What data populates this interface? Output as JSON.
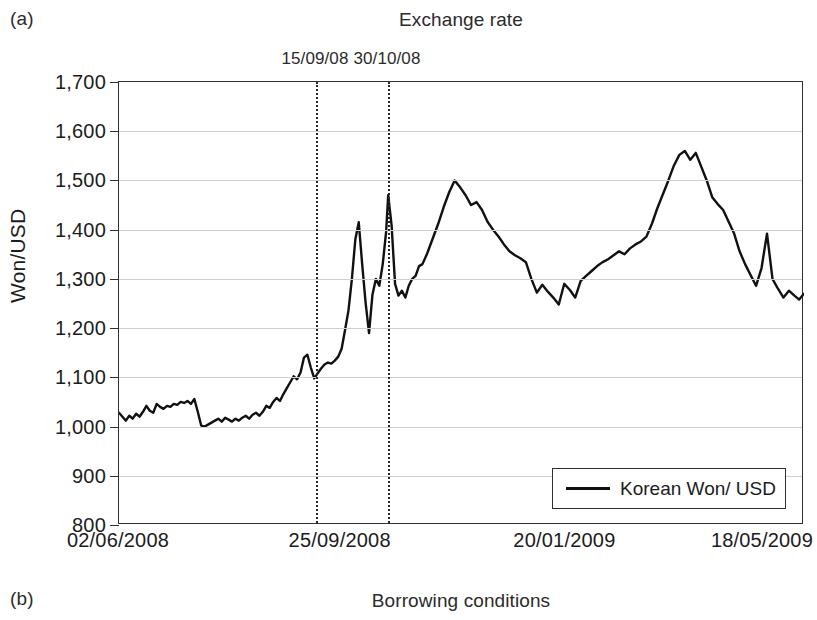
{
  "figure": {
    "panel_a_letter": "(a)",
    "panel_a_title": "Exchange rate",
    "panel_b_letter": "(b)",
    "panel_b_title": "Borrowing conditions"
  },
  "axes": {
    "y_title": "Won/USD",
    "y_ticks": [
      "1,700",
      "1,600",
      "1,500",
      "1,400",
      "1,300",
      "1,200",
      "1,100",
      "1,000",
      "900",
      "800"
    ],
    "x_ticks": [
      "02/06/2008",
      "25/09/2008",
      "20/01/2009",
      "18/05/2009"
    ]
  },
  "events": [
    {
      "label": "15/09/08",
      "x_frac": 0.2876
    },
    {
      "label": "30/10/08",
      "x_frac": 0.3927
    }
  ],
  "legend": {
    "label": "Korean Won/ USD",
    "line_color": "#111111"
  },
  "chart_data": {
    "type": "line",
    "title": "Exchange rate",
    "xlabel": "",
    "ylabel": "Won/USD",
    "ylim": [
      800,
      1700
    ],
    "ytick_step": 100,
    "grid": true,
    "legend_position": "bottom-right",
    "x_tick_labels": [
      "02/06/2008",
      "25/09/2008",
      "20/01/2009",
      "18/05/2009"
    ],
    "x_tick_fracs": [
      0.0,
      0.3236,
      0.6517,
      0.9651
    ],
    "annotations": [
      {
        "text": "15/09/08",
        "type": "vertical-dotted-line",
        "x_frac": 0.2876
      },
      {
        "text": "30/10/08",
        "type": "vertical-dotted-line",
        "x_frac": 0.3927
      }
    ],
    "series": [
      {
        "name": "Korean Won/ USD",
        "color": "#111111",
        "x": [
          0.0,
          0.005,
          0.01,
          0.015,
          0.02,
          0.025,
          0.03,
          0.035,
          0.04,
          0.045,
          0.05,
          0.055,
          0.06,
          0.065,
          0.07,
          0.075,
          0.08,
          0.085,
          0.09,
          0.095,
          0.1,
          0.105,
          0.11,
          0.115,
          0.12,
          0.125,
          0.13,
          0.135,
          0.14,
          0.145,
          0.15,
          0.155,
          0.16,
          0.165,
          0.17,
          0.175,
          0.18,
          0.185,
          0.19,
          0.195,
          0.2,
          0.205,
          0.21,
          0.215,
          0.22,
          0.225,
          0.23,
          0.235,
          0.24,
          0.245,
          0.25,
          0.255,
          0.26,
          0.265,
          0.27,
          0.275,
          0.28,
          0.285,
          0.29,
          0.295,
          0.3,
          0.305,
          0.31,
          0.315,
          0.32,
          0.325,
          0.33,
          0.335,
          0.34,
          0.345,
          0.35,
          0.355,
          0.36,
          0.365,
          0.37,
          0.375,
          0.38,
          0.385,
          0.39,
          0.393,
          0.398,
          0.403,
          0.408,
          0.413,
          0.418,
          0.423,
          0.428,
          0.433,
          0.438,
          0.443,
          0.45,
          0.458,
          0.466,
          0.474,
          0.482,
          0.49,
          0.498,
          0.506,
          0.514,
          0.522,
          0.53,
          0.538,
          0.546,
          0.554,
          0.562,
          0.57,
          0.578,
          0.586,
          0.594,
          0.602,
          0.61,
          0.618,
          0.626,
          0.634,
          0.642,
          0.65,
          0.658,
          0.666,
          0.674,
          0.682,
          0.69,
          0.698,
          0.706,
          0.714,
          0.722,
          0.73,
          0.738,
          0.746,
          0.754,
          0.762,
          0.77,
          0.778,
          0.786,
          0.794,
          0.802,
          0.81,
          0.818,
          0.826,
          0.834,
          0.842,
          0.85,
          0.858,
          0.866,
          0.874,
          0.882,
          0.89,
          0.898,
          0.906,
          0.914,
          0.922,
          0.93,
          0.938,
          0.946,
          0.954,
          0.962,
          0.97,
          0.978,
          0.986,
          0.993,
          1.0
        ],
        "y": [
          1028,
          1020,
          1012,
          1022,
          1016,
          1026,
          1020,
          1030,
          1042,
          1032,
          1028,
          1046,
          1040,
          1036,
          1042,
          1040,
          1046,
          1044,
          1050,
          1048,
          1052,
          1046,
          1056,
          1030,
          1002,
          1000,
          1004,
          1008,
          1012,
          1016,
          1010,
          1018,
          1014,
          1010,
          1016,
          1012,
          1018,
          1022,
          1016,
          1024,
          1028,
          1022,
          1030,
          1042,
          1038,
          1050,
          1058,
          1052,
          1066,
          1078,
          1090,
          1102,
          1096,
          1110,
          1140,
          1146,
          1120,
          1098,
          1108,
          1118,
          1126,
          1130,
          1128,
          1134,
          1142,
          1158,
          1196,
          1236,
          1300,
          1380,
          1415,
          1330,
          1252,
          1190,
          1268,
          1300,
          1286,
          1330,
          1396,
          1470,
          1408,
          1290,
          1266,
          1276,
          1262,
          1286,
          1300,
          1306,
          1326,
          1330,
          1352,
          1382,
          1412,
          1446,
          1476,
          1500,
          1486,
          1470,
          1450,
          1456,
          1440,
          1416,
          1400,
          1386,
          1370,
          1356,
          1348,
          1342,
          1334,
          1300,
          1272,
          1288,
          1274,
          1262,
          1248,
          1290,
          1278,
          1262,
          1296,
          1306,
          1316,
          1326,
          1334,
          1340,
          1348,
          1356,
          1350,
          1362,
          1370,
          1376,
          1386,
          1412,
          1444,
          1472,
          1500,
          1530,
          1552,
          1560,
          1542,
          1556,
          1528,
          1500,
          1466,
          1452,
          1440,
          1416,
          1392,
          1356,
          1330,
          1308,
          1286,
          1322,
          1392,
          1300,
          1280,
          1262,
          1276,
          1266,
          1258,
          1270
        ]
      }
    ]
  }
}
